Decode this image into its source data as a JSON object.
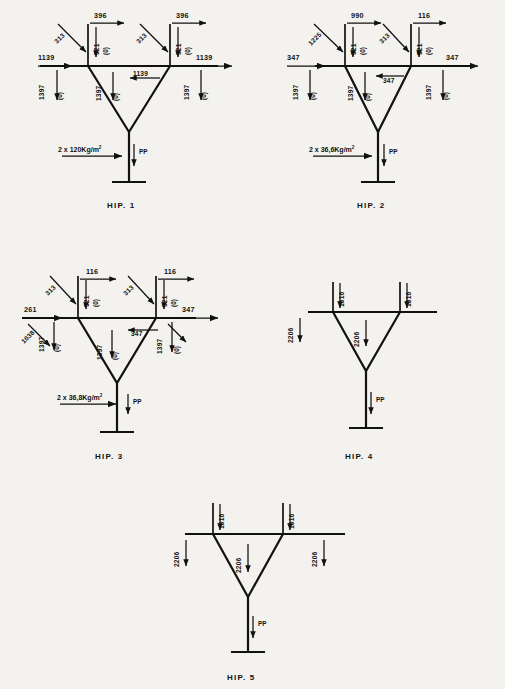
{
  "document": {
    "title": "Structural load hypothesis diagrams",
    "type": "engineering-load-diagram-sheet",
    "units": "kg / kg per square metre",
    "background_color": "#f4f2ee",
    "ink_color": "#111111"
  },
  "common": {
    "zero_bracket": "(0)",
    "self_weight_label": "PP",
    "superscript_two": "2"
  },
  "diagrams": [
    {
      "id": "hip-1",
      "caption": "HIP. 1",
      "surface_load": "2 x 120Kg/m",
      "surface_load_exponent": "2",
      "self_weight": "PP",
      "labels": {
        "left_horizontal": "1139",
        "right_horizontal": "1139",
        "left_diagonal": "313",
        "right_diagonal": "313",
        "left_top_horizontal": "396",
        "right_top_horizontal": "396",
        "left_column_vertical": "521",
        "right_column_vertical": "521",
        "left_support_vertical": "1397",
        "center_vertical": "1397",
        "right_support_vertical": "1397",
        "center_horizontal": "1139",
        "zero": "(0)"
      }
    },
    {
      "id": "hip-2",
      "caption": "HIP. 2",
      "surface_load": "2 x 36,6Kg/m",
      "surface_load_exponent": "2",
      "self_weight": "PP",
      "labels": {
        "left_horizontal": "347",
        "right_horizontal": "347",
        "left_diagonal": "1225",
        "right_diagonal": "313",
        "left_top_horizontal": "990",
        "right_top_horizontal": "116",
        "left_column_vertical": "521",
        "right_column_vertical": "521",
        "left_support_vertical": "1397",
        "center_vertical": "1397",
        "right_support_vertical": "1397",
        "center_horizontal": "347",
        "zero": "(0)"
      }
    },
    {
      "id": "hip-3",
      "caption": "HIP. 3",
      "surface_load": "2 x 36,8Kg/m",
      "surface_load_exponent": "2",
      "self_weight": "PP",
      "labels": {
        "left_horizontal": "261",
        "right_horizontal": "347",
        "left_outer_diagonal": "1038",
        "left_diagonal": "313",
        "right_diagonal": "313",
        "left_top_horizontal": "116",
        "right_top_horizontal": "116",
        "left_column_vertical": "521",
        "right_column_vertical": "521",
        "left_support_vertical": "1397",
        "center_vertical": "1397",
        "right_support_vertical": "1397",
        "center_horizontal": "347",
        "zero": "(0)"
      }
    },
    {
      "id": "hip-4",
      "caption": "HIP. 4",
      "surface_load": "",
      "self_weight": "PP",
      "labels": {
        "left_top_vertical": "1016",
        "right_top_vertical": "1016",
        "left_support_vertical": "2206",
        "center_vertical": "2206"
      }
    },
    {
      "id": "hip-5",
      "caption": "HIP. 5",
      "surface_load": "",
      "self_weight": "PP",
      "labels": {
        "left_top_vertical": "1016",
        "right_top_vertical": "1016",
        "left_support_vertical": "2206",
        "center_vertical": "2206",
        "right_support_vertical": "2206"
      }
    }
  ]
}
